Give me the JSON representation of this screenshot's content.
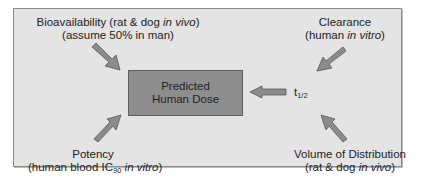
{
  "diagram": {
    "type": "flow-inputs-to-output",
    "colors": {
      "panel_background": "#e4e4e4",
      "panel_border": "#8a8a8a",
      "center_box_fill": "#8e8e8e",
      "arrow_fill": "#8c8c8c"
    },
    "center": {
      "line1": "Predicted",
      "line2": "Human Dose"
    },
    "inputs": {
      "bioavailability": {
        "line1_pre": "Bioavailability (rat & dog ",
        "line1_italic": "in vivo",
        "line1_post": ")",
        "line2": "(assume 50% in man)"
      },
      "clearance": {
        "line1": "Clearance",
        "line2_pre": "(human ",
        "line2_italic": "in vitro",
        "line2_post": ")"
      },
      "potency": {
        "line1": "Potency",
        "line2_pre": "(human blood IC",
        "line2_sub": "90",
        "line2_mid": " ",
        "line2_italic": "in vitro",
        "line2_post": ")"
      },
      "volume_of_distribution": {
        "line1": "Volume of Distribution",
        "line2_pre": "(rat & dog ",
        "line2_italic": "in vivo",
        "line2_post": ")"
      },
      "half_life": {
        "symbol": "t",
        "subscript": "1/2"
      }
    }
  }
}
